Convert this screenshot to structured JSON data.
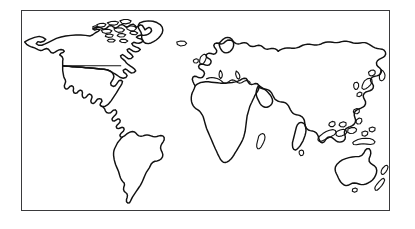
{
  "figure": {
    "kind": "world-map-outline",
    "title": "",
    "background_color": "#ffffff",
    "frame": {
      "border_color": "#3a3a3c",
      "border_width_px": 1.5,
      "fill_color": "#ffffff",
      "left_px": 21,
      "top_px": 10,
      "width_px": 369,
      "height_px": 201
    },
    "coastline": {
      "stroke_color": "#111111",
      "stroke_width_px": 1.4,
      "fill_color": "none"
    },
    "labels": [],
    "legend": [],
    "landmasses": [
      {
        "name": "north-america",
        "label": ""
      },
      {
        "name": "greenland",
        "label": ""
      },
      {
        "name": "south-america",
        "label": ""
      },
      {
        "name": "africa",
        "label": ""
      },
      {
        "name": "madagascar",
        "label": ""
      },
      {
        "name": "europe",
        "label": ""
      },
      {
        "name": "british-isles",
        "label": ""
      },
      {
        "name": "scandinavia",
        "label": ""
      },
      {
        "name": "asia",
        "label": ""
      },
      {
        "name": "japan",
        "label": ""
      },
      {
        "name": "southeast-asia-islands",
        "label": ""
      },
      {
        "name": "australia",
        "label": ""
      },
      {
        "name": "new-zealand",
        "label": ""
      },
      {
        "name": "canadian-arctic-islands",
        "label": ""
      },
      {
        "name": "iceland",
        "label": ""
      },
      {
        "name": "sri-lanka",
        "label": ""
      },
      {
        "name": "usa-canada-border",
        "label": ""
      }
    ]
  }
}
